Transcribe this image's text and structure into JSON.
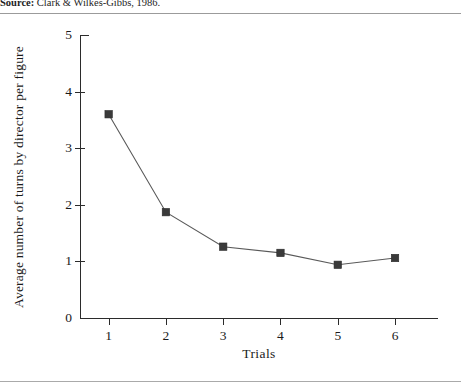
{
  "caption": {
    "source_label": "Source:",
    "source_text": " Clark & Wilkes-Gibbs, 1986."
  },
  "colors": {
    "line": "#595959",
    "marker": "#3a3a3a",
    "axis": "#2b2b2b",
    "rule": "#9b9b9b",
    "background": "#ffffff"
  },
  "chart_data": {
    "type": "line",
    "title": "",
    "subtitle": "",
    "xlabel": "Trials",
    "ylabel": "Average number of turns by director per figure",
    "x": [
      1,
      2,
      3,
      4,
      5,
      6
    ],
    "values": [
      3.6,
      1.87,
      1.26,
      1.15,
      0.94,
      1.06
    ],
    "xticklabels": [
      "1",
      "2",
      "3",
      "4",
      "5",
      "6"
    ],
    "yticklabels": [
      "0",
      "1",
      "2",
      "3",
      "4",
      "5"
    ],
    "yticks": [
      0,
      1,
      2,
      3,
      4,
      5
    ],
    "xlim": [
      0.5,
      6.75
    ],
    "ylim": [
      0,
      5
    ],
    "grid": false,
    "legend": null,
    "marker": "square",
    "annotations": []
  }
}
